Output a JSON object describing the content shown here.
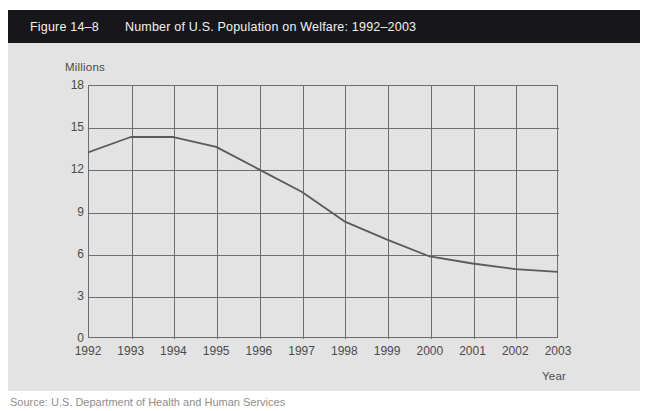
{
  "header": {
    "figure_number": "Figure 14–8",
    "title": "Number of U.S. Population on Welfare: 1992–2003",
    "bar_color": "#17161a",
    "text_color": "#f2f2f2"
  },
  "panel": {
    "background_color": "#e3e3e3"
  },
  "source": {
    "text": "Source: U.S. Department of Health and Human Services"
  },
  "chart_data": {
    "type": "line",
    "title": "Number of U.S. Population on Welfare: 1992–2003",
    "xlabel": "Year",
    "ylabel": "Millions",
    "x": [
      1992,
      1993,
      1994,
      1995,
      1996,
      1997,
      1998,
      1999,
      2000,
      2001,
      2002,
      2003
    ],
    "categories": [
      "1992",
      "1993",
      "1994",
      "1995",
      "1996",
      "1997",
      "1998",
      "1999",
      "2000",
      "2001",
      "2002",
      "2003"
    ],
    "values": [
      13.2,
      14.3,
      14.3,
      13.6,
      12.0,
      10.4,
      8.3,
      7.0,
      5.8,
      5.3,
      4.9,
      4.7
    ],
    "series": [
      {
        "name": "U.S. Population on Welfare (millions)",
        "values": [
          13.2,
          14.3,
          14.3,
          13.6,
          12.0,
          10.4,
          8.3,
          7.0,
          5.8,
          5.3,
          4.9,
          4.7
        ]
      }
    ],
    "ylim": [
      0,
      18
    ],
    "yticks": [
      0,
      3,
      6,
      9,
      12,
      15,
      18
    ],
    "ytick_labels": [
      "0",
      "3",
      "6",
      "9",
      "12",
      "15",
      "18"
    ],
    "xlim": [
      1992,
      2003
    ],
    "xticks": [
      1992,
      1993,
      1994,
      1995,
      1996,
      1997,
      1998,
      1999,
      2000,
      2001,
      2002,
      2003
    ],
    "xtick_labels": [
      "1992",
      "1993",
      "1994",
      "1995",
      "1996",
      "1997",
      "1998",
      "1999",
      "2000",
      "2001",
      "2002",
      "2003"
    ],
    "grid": true,
    "legend": false,
    "line_color": "#5a5a5a",
    "grid_color": "#6e6e6e"
  }
}
